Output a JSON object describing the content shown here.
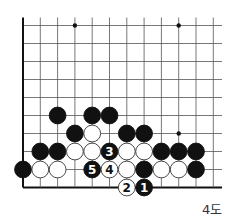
{
  "diagram": {
    "caption": "4도",
    "grid": {
      "origin_x": 23,
      "origin_y": 25.5,
      "col_spacing": 17.3,
      "row_spacing": 18,
      "cols": 12,
      "rows": 10,
      "right_extent": 222,
      "left_edge": true,
      "bottom_edge": true
    },
    "star_points": [
      {
        "col": 3,
        "row": 0
      },
      {
        "col": 9,
        "row": 0
      },
      {
        "col": 9,
        "row": 6
      }
    ],
    "stones": [
      {
        "color": "black",
        "col": 2,
        "row": 5
      },
      {
        "color": "black",
        "col": 4,
        "row": 5
      },
      {
        "color": "black",
        "col": 5,
        "row": 5
      },
      {
        "color": "black",
        "col": 3,
        "row": 6
      },
      {
        "color": "white",
        "col": 4,
        "row": 6
      },
      {
        "color": "black",
        "col": 6,
        "row": 6
      },
      {
        "color": "black",
        "col": 7,
        "row": 6
      },
      {
        "color": "black",
        "col": 1,
        "row": 7
      },
      {
        "color": "black",
        "col": 2,
        "row": 7
      },
      {
        "color": "white",
        "col": 3,
        "row": 7
      },
      {
        "color": "white",
        "col": 4,
        "row": 7
      },
      {
        "color": "black",
        "col": 5,
        "row": 7,
        "label": "3"
      },
      {
        "color": "white",
        "col": 6,
        "row": 7
      },
      {
        "color": "white",
        "col": 7,
        "row": 7
      },
      {
        "color": "black",
        "col": 8,
        "row": 7
      },
      {
        "color": "black",
        "col": 9,
        "row": 7
      },
      {
        "color": "black",
        "col": 10,
        "row": 7
      },
      {
        "color": "black",
        "col": 0,
        "row": 8
      },
      {
        "color": "white",
        "col": 1,
        "row": 8
      },
      {
        "color": "white",
        "col": 2,
        "row": 8
      },
      {
        "color": "black",
        "col": 4,
        "row": 8,
        "label": "5"
      },
      {
        "color": "white",
        "col": 5,
        "row": 8,
        "label": "4"
      },
      {
        "color": "white",
        "col": 6,
        "row": 8
      },
      {
        "color": "black",
        "col": 7,
        "row": 8
      },
      {
        "color": "white",
        "col": 8,
        "row": 8
      },
      {
        "color": "white",
        "col": 9,
        "row": 8
      },
      {
        "color": "black",
        "col": 10,
        "row": 8
      },
      {
        "color": "white",
        "col": 6,
        "row": 9,
        "label": "2"
      },
      {
        "color": "black",
        "col": 7,
        "row": 9,
        "label": "1"
      }
    ],
    "colors": {
      "line": "#555555",
      "edge": "#111111",
      "black_stone": "#111111",
      "white_stone": "#ffffff",
      "white_stroke": "#333333"
    }
  }
}
